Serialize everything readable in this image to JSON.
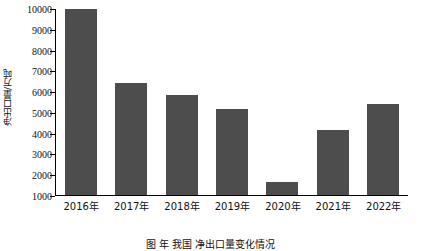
{
  "chart_data": {
    "type": "bar",
    "title": "",
    "subtitle": "",
    "xlabel": "",
    "ylabel": "净出口量/万吨",
    "categories": [
      "2016年",
      "2017年",
      "2018年",
      "2019年",
      "2020年",
      "2021年",
      "2022年"
    ],
    "values": [
      9950,
      6400,
      5800,
      5150,
      1650,
      4130,
      5400
    ],
    "series": [
      {
        "name": "净出口量",
        "values": [
          9950,
          6400,
          5800,
          5150,
          1650,
          4130,
          5400
        ]
      }
    ],
    "ylim": [
      1000,
      10000
    ],
    "ytick_labels": [
      "1000",
      "2000",
      "3000",
      "4000",
      "5000",
      "6000",
      "7000",
      "8000",
      "9000",
      "10000"
    ],
    "ytick_values": [
      1000,
      2000,
      3000,
      4000,
      5000,
      6000,
      7000,
      8000,
      9000,
      10000
    ],
    "grid": false,
    "legend": null,
    "legend_position": "none",
    "bar_color": "#4d4d4d",
    "axis_color": "#000000",
    "background_color": "#ffffff",
    "annotations": []
  },
  "caption": {
    "text": "图   年  我国  净出口量变化情况"
  }
}
